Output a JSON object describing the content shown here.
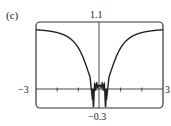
{
  "panel_label": "(c)",
  "chart_data": {
    "type": "line",
    "title": "",
    "xlabel": "",
    "ylabel": "",
    "xlim": [
      -3,
      3
    ],
    "ylim": [
      -0.3,
      1.1
    ],
    "x_tick_labels": [
      "-3",
      "3"
    ],
    "y_tick_labels": [
      "1.1",
      "-0.3"
    ],
    "x_ticks": [
      -3,
      -2,
      -1,
      0,
      1,
      2,
      3
    ],
    "grid": false,
    "legend": null,
    "series": [
      {
        "name": "f(x)",
        "x": [
          -3.0,
          -2.5,
          -2.0,
          -1.5,
          -1.2,
          -1.0,
          -0.8,
          -0.6,
          -0.5,
          -0.4,
          -0.35,
          -0.3,
          -0.25,
          -0.2,
          -0.15,
          -0.1,
          -0.05,
          0.0,
          0.05,
          0.1,
          0.15,
          0.2,
          0.25,
          0.3,
          0.35,
          0.4,
          0.5,
          0.6,
          0.8,
          1.0,
          1.2,
          1.5,
          2.0,
          2.5,
          3.0
        ],
        "y": [
          0.99,
          0.98,
          0.96,
          0.91,
          0.85,
          0.78,
          0.66,
          0.44,
          0.28,
          0.08,
          -0.06,
          -0.2,
          -0.05,
          0.1,
          -0.02,
          0.12,
          0.02,
          0.05,
          0.02,
          0.12,
          -0.02,
          0.1,
          -0.05,
          -0.2,
          -0.06,
          0.08,
          0.28,
          0.44,
          0.66,
          0.78,
          0.85,
          0.91,
          0.96,
          0.98,
          0.99
        ]
      }
    ],
    "labels": {
      "y_max": "1.1",
      "y_min": "−0.3",
      "x_min": "−3",
      "x_max": "3"
    }
  }
}
